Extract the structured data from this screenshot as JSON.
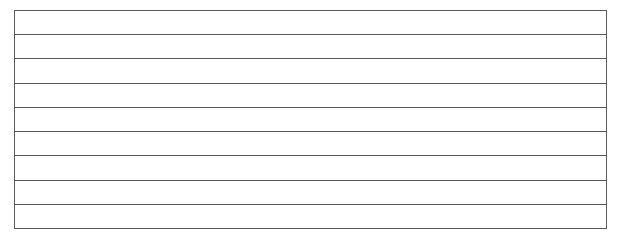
{
  "lined_box": {
    "row_count": 9,
    "rows": [
      "",
      "",
      "",
      "",
      "",
      "",
      "",
      "",
      ""
    ],
    "line_color": "#5a5a5a",
    "background_color": "#ffffff"
  }
}
